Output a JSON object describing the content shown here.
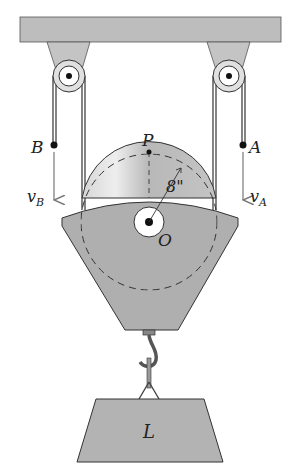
{
  "diagram": {
    "labels": {
      "point_a": "A",
      "point_b": "B",
      "point_p": "P",
      "center_o": "O",
      "velocity_a": "v",
      "velocity_a_sub": "A",
      "velocity_b": "v",
      "velocity_b_sub": "B",
      "radius": "8\"",
      "load": "L"
    },
    "colors": {
      "ceiling": "#b9b9b9",
      "body": "#adadad",
      "pulley": "#c8c8c8",
      "rope": "#333333",
      "arrow": "#777777"
    }
  }
}
